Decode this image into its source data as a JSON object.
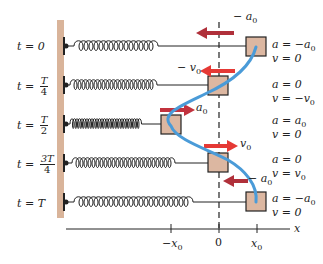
{
  "diagram": {
    "title": "",
    "colors": {
      "wall": "#d9b49a",
      "block_fill": "#dcb7a1",
      "arrow_red": "#e53935",
      "arrow_dark_red": "#b0303a",
      "curve_blue": "#4a9bd8",
      "ink": "#222222"
    },
    "rows": [
      {
        "time_label": "t = 0",
        "frac": null,
        "a_line": "a = −a",
        "a_sub": "0",
        "v_line": "v = 0",
        "v_sub": "",
        "arrow_label": "− a",
        "arrow_sub": "0",
        "arrow_direction": "left"
      },
      {
        "time_label": "t =",
        "frac": {
          "num": "T",
          "den": "4"
        },
        "a_line": "a = 0",
        "a_sub": "",
        "v_line": "v = −v",
        "v_sub": "0",
        "arrow_label": "− v",
        "arrow_sub": "0",
        "arrow_direction": "left"
      },
      {
        "time_label": "t =",
        "frac": {
          "num": "T",
          "den": "2"
        },
        "a_line": "a = a",
        "a_sub": "0",
        "v_line": "v = 0",
        "v_sub": "",
        "arrow_label": "a",
        "arrow_sub": "0",
        "arrow_direction": "right"
      },
      {
        "time_label": "t =",
        "frac": {
          "num": "3T",
          "den": "4"
        },
        "a_line": "a = 0",
        "a_sub": "",
        "v_line": "v = v",
        "v_sub": "0",
        "arrow_label": "v",
        "arrow_sub": "0",
        "arrow_direction": "right"
      },
      {
        "time_label": "t = T",
        "frac": null,
        "a_line": "a = −a",
        "a_sub": "0",
        "v_line": "v = 0",
        "v_sub": "",
        "arrow_label": "− a",
        "arrow_sub": "0",
        "arrow_direction": "left"
      }
    ],
    "axis": {
      "label": "x",
      "ticks": [
        {
          "label": "−x",
          "sub": "0"
        },
        {
          "label": "0",
          "sub": ""
        },
        {
          "label": "x",
          "sub": "0"
        }
      ]
    }
  }
}
